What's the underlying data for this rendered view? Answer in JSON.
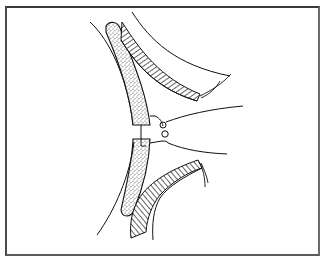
{
  "figure": {
    "type": "line-illustration",
    "description": "Surgical illustration: two curved bone segments with a suture tied across the gap, flanked by hatched soft tissue layers",
    "colors": {
      "line": "#111111",
      "stipple": "#555555",
      "border": "#3a3a3a",
      "background": "#ffffff"
    },
    "elements": [
      {
        "name": "upper-bone-segment",
        "fill": "stippled"
      },
      {
        "name": "lower-bone-segment",
        "fill": "stippled"
      },
      {
        "name": "upper-soft-tissue-flap",
        "fill": "hatched"
      },
      {
        "name": "lower-soft-tissue-flap",
        "fill": "hatched"
      },
      {
        "name": "suture-knot",
        "fill": "none"
      },
      {
        "name": "suture-strands",
        "count": 2
      }
    ]
  }
}
